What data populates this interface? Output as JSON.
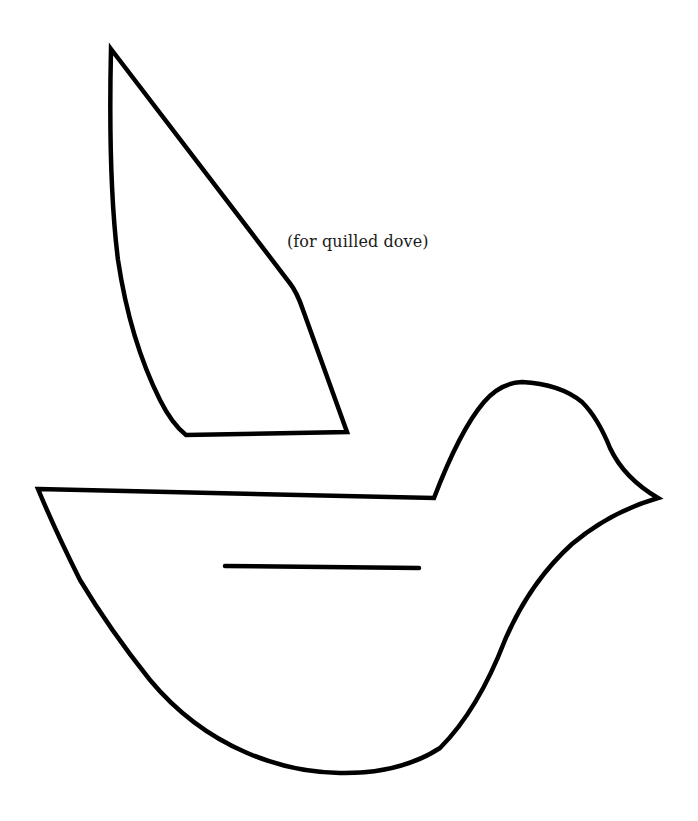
{
  "template": {
    "caption": "(for quilled dove)",
    "stroke_color": "#000000",
    "background_color": "#ffffff"
  },
  "pieces": [
    {
      "name": "wing",
      "description": "Wing template piece"
    },
    {
      "name": "body",
      "description": "Dove body template piece"
    },
    {
      "name": "wing-slot",
      "description": "Slot line on body for wing insertion"
    }
  ]
}
